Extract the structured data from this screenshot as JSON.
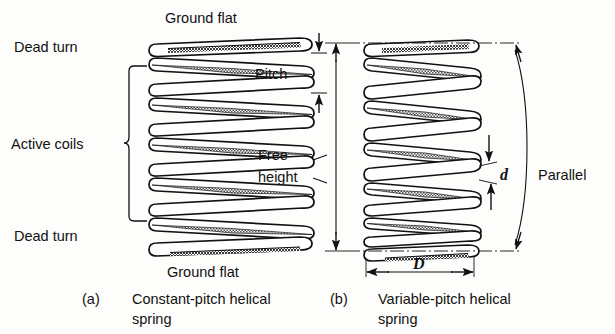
{
  "figure": {
    "type": "technical-diagram",
    "background_color": "#fdfdfb",
    "ink_color": "#111111",
    "shade_color": "#6e6e6e"
  },
  "panel_a": {
    "key": "(a)",
    "caption_line1": "Constant-pitch helical",
    "caption_line2": "spring",
    "labels": {
      "ground_flat_top": "Ground flat",
      "ground_flat_bottom": "Ground flat",
      "dead_turn_top": "Dead turn",
      "dead_turn_bottom": "Dead turn",
      "active_coils": "Active coils",
      "pitch": "Pitch",
      "free_height_line1": "Free",
      "free_height_line2": "height"
    },
    "coil_count": 9,
    "active_coil_count": 7,
    "dead_turn_count": 2,
    "pitch_constant": true
  },
  "panel_b": {
    "key": "(b)",
    "caption_line1": "Variable-pitch helical",
    "caption_line2": "spring",
    "labels": {
      "parallel": "Parallel",
      "wire_diameter": "d",
      "coil_diameter": "D"
    },
    "coil_count": 9,
    "pitch_constant": false,
    "pitch_note": "pitch decreases from top to bottom"
  }
}
